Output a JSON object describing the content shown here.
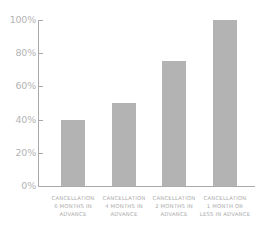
{
  "chart_data": {
    "type": "bar",
    "title": "",
    "xlabel": "",
    "ylabel": "",
    "categories": [
      "CANCELLATION 6 MONTHS IN ADVANCE",
      "CANCELLATION 4 MONTHS IN ADVANCE",
      "CANCELLATION 2 MONTHS IN ADVANCE",
      "CANCELLATION 1 MONTH OR LESS IN ADVANCE"
    ],
    "values": [
      40,
      50,
      75,
      100
    ],
    "ylim": [
      0,
      100
    ],
    "yticks": [
      "0%",
      "20%",
      "40%",
      "60%",
      "80%",
      "100%"
    ],
    "grid": false,
    "legend": null,
    "bar_color": "#b3b3b3"
  },
  "y_axis": {
    "ticks": [
      {
        "label": "100%",
        "value": 100
      },
      {
        "label": "80%",
        "value": 80
      },
      {
        "label": "60%",
        "value": 60
      },
      {
        "label": "40%",
        "value": 40
      },
      {
        "label": "20%",
        "value": 20
      },
      {
        "label": "0%",
        "value": 0
      }
    ]
  },
  "x_axis": {
    "labels": [
      {
        "lines": [
          "CANCELLATION",
          "6 MONTHS IN",
          "ADVANCE"
        ]
      },
      {
        "lines": [
          "CANCELLATION",
          "4 MONTHS IN",
          "ADVANCE"
        ]
      },
      {
        "lines": [
          "CANCELLATION",
          "2 MONTHS IN",
          "ADVANCE"
        ]
      },
      {
        "lines": [
          "CANCELLATION",
          "1 MONTH OR",
          "LESS IN ADVANCE"
        ]
      }
    ]
  }
}
